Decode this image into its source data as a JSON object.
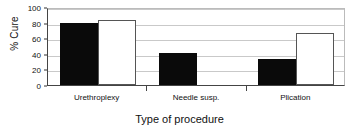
{
  "chart_data": {
    "type": "bar",
    "title": "",
    "xlabel": "Type of procedure",
    "ylabel": "% Cure",
    "categories": [
      "Urethroplexy",
      "Needle susp.",
      "Plication"
    ],
    "ylim": [
      0,
      100
    ],
    "yticks": [
      0,
      20,
      40,
      60,
      80,
      100
    ],
    "ytick_labels": [
      "0",
      "20",
      "40",
      "60",
      "80",
      "100"
    ],
    "grid": true,
    "legend": "none",
    "series": [
      {
        "name": "filled",
        "style": "black filled",
        "values": [
          80,
          41,
          33
        ]
      },
      {
        "name": "open",
        "style": "white open",
        "values": [
          83,
          null,
          67
        ]
      }
    ]
  }
}
